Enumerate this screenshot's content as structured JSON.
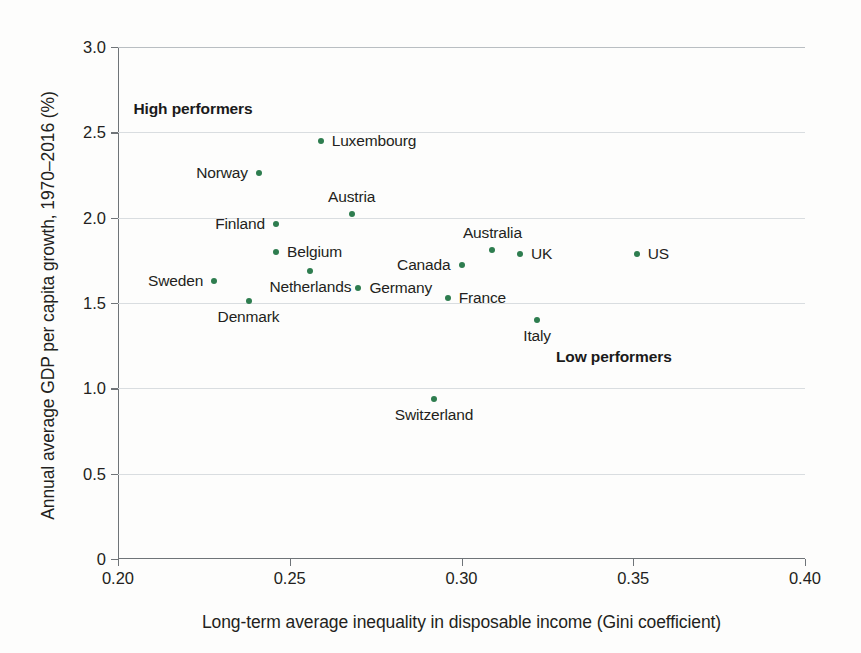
{
  "chart_data": {
    "type": "scatter",
    "title": "",
    "xlabel": "Long-term average inequality in disposable income (Gini coefficient)",
    "ylabel": "Annual average GDP per capita growth, 1970–2016 (%)",
    "xlim": [
      0.2,
      0.4
    ],
    "ylim": [
      0,
      3.0
    ],
    "xticks": [
      "0.20",
      "0.25",
      "0.30",
      "0.35",
      "0.40"
    ],
    "xtick_values": [
      0.2,
      0.25,
      0.3,
      0.35,
      0.4
    ],
    "yticks": [
      "0",
      "0.5",
      "1.0",
      "1.5",
      "2.0",
      "2.5",
      "3.0"
    ],
    "ytick_values": [
      0,
      0.5,
      1.0,
      1.5,
      2.0,
      2.5,
      3.0
    ],
    "grid": true,
    "legend": "none",
    "marker_color": "#2e7d4f",
    "points": [
      {
        "name": "Sweden",
        "x": 0.228,
        "y": 1.63,
        "label_pos": "left"
      },
      {
        "name": "Denmark",
        "x": 0.238,
        "y": 1.51,
        "label_pos": "below"
      },
      {
        "name": "Norway",
        "x": 0.241,
        "y": 2.26,
        "label_pos": "left"
      },
      {
        "name": "Finland",
        "x": 0.246,
        "y": 1.96,
        "label_pos": "left"
      },
      {
        "name": "Belgium",
        "x": 0.246,
        "y": 1.8,
        "label_pos": "right"
      },
      {
        "name": "Netherlands",
        "x": 0.256,
        "y": 1.69,
        "label_pos": "below"
      },
      {
        "name": "Luxembourg",
        "x": 0.259,
        "y": 2.45,
        "label_pos": "right"
      },
      {
        "name": "Austria",
        "x": 0.268,
        "y": 2.02,
        "label_pos": "above"
      },
      {
        "name": "Germany",
        "x": 0.27,
        "y": 1.59,
        "label_pos": "right"
      },
      {
        "name": "Switzerland",
        "x": 0.292,
        "y": 0.94,
        "label_pos": "below"
      },
      {
        "name": "Canada",
        "x": 0.3,
        "y": 1.72,
        "label_pos": "left"
      },
      {
        "name": "France",
        "x": 0.296,
        "y": 1.53,
        "label_pos": "right"
      },
      {
        "name": "Australia",
        "x": 0.309,
        "y": 1.81,
        "label_pos": "above"
      },
      {
        "name": "UK",
        "x": 0.317,
        "y": 1.79,
        "label_pos": "right"
      },
      {
        "name": "Italy",
        "x": 0.322,
        "y": 1.4,
        "label_pos": "below"
      },
      {
        "name": "US",
        "x": 0.351,
        "y": 1.79,
        "label_pos": "right"
      }
    ],
    "annotations": [
      {
        "name": "high-performers",
        "text": "High performers",
        "x": 0.2045,
        "y": 2.69
      },
      {
        "name": "low-performers",
        "text": "Low performers",
        "x": 0.3275,
        "y": 1.235
      }
    ]
  }
}
